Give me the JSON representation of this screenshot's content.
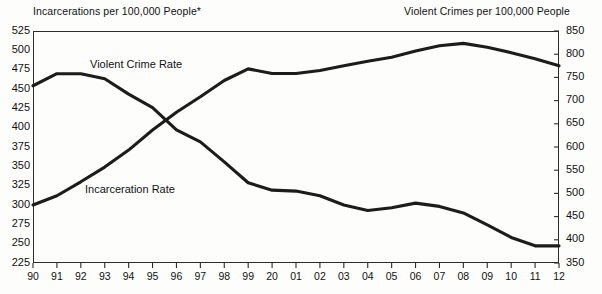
{
  "chart_data": {
    "type": "line",
    "title": "",
    "left_axis": {
      "label": "Incarcerations per 100,000 People*",
      "ticks": [
        225,
        250,
        275,
        300,
        325,
        350,
        375,
        400,
        425,
        450,
        475,
        500,
        525
      ],
      "ylim": [
        225,
        525
      ]
    },
    "right_axis": {
      "label": "Violent Crimes per 100,000 People",
      "ticks": [
        350,
        400,
        450,
        500,
        550,
        600,
        650,
        700,
        750,
        800,
        850
      ],
      "ylim": [
        350,
        850
      ]
    },
    "xlabel": "",
    "categories": [
      "90",
      "91",
      "92",
      "93",
      "94",
      "95",
      "96",
      "97",
      "98",
      "99",
      "20",
      "01",
      "02",
      "03",
      "04",
      "05",
      "06",
      "07",
      "08",
      "09",
      "10",
      "11",
      "12"
    ],
    "grid": false,
    "legend_position": "inline-annotations",
    "series": [
      {
        "name": "Incarceration Rate",
        "axis": "left",
        "label_text": "Incarceration Rate",
        "color": "#1c1c1c",
        "values": [
          300,
          312,
          330,
          349,
          371,
          397,
          420,
          440,
          461,
          476,
          470,
          470,
          474,
          480,
          486,
          491,
          499,
          506,
          509,
          504,
          497,
          489,
          480
        ]
      },
      {
        "name": "Violent Crime Rate",
        "axis": "right",
        "label_text": "Violent Crime Rate",
        "color": "#1c1c1c",
        "values": [
          732,
          758,
          758,
          747,
          714,
          685,
          637,
          611,
          568,
          523,
          507,
          505,
          495,
          475,
          463,
          469,
          479,
          472,
          458,
          432,
          405,
          387,
          387
        ]
      }
    ],
    "footnote": "*"
  }
}
